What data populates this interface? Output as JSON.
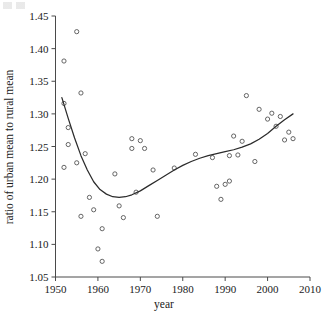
{
  "chart_data": {
    "type": "scatter",
    "title": "",
    "xlabel": "year",
    "ylabel": "ratio of urban mean to rural mean",
    "xlim": [
      1950,
      2010
    ],
    "ylim": [
      1.05,
      1.45
    ],
    "xticks": [
      1950,
      1960,
      1970,
      1980,
      1990,
      2000,
      2010
    ],
    "yticks": [
      1.05,
      1.1,
      1.15,
      1.2,
      1.25,
      1.3,
      1.35,
      1.4,
      1.45
    ],
    "xtick_labels": [
      "1950",
      "1960",
      "1970",
      "1980",
      "1990",
      "2000",
      "2010"
    ],
    "ytick_labels": [
      "1.05",
      "1.10",
      "1.15",
      "1.20",
      "1.25",
      "1.30",
      "1.35",
      "1.40",
      "1.45"
    ],
    "grid": false,
    "legend": "none",
    "marker": "open-circle",
    "points": [
      {
        "x": 1952,
        "y": 1.381
      },
      {
        "x": 1952,
        "y": 1.316
      },
      {
        "x": 1952,
        "y": 1.218
      },
      {
        "x": 1953,
        "y": 1.279
      },
      {
        "x": 1953,
        "y": 1.253
      },
      {
        "x": 1955,
        "y": 1.426
      },
      {
        "x": 1955,
        "y": 1.225
      },
      {
        "x": 1956,
        "y": 1.332
      },
      {
        "x": 1956,
        "y": 1.143
      },
      {
        "x": 1957,
        "y": 1.239
      },
      {
        "x": 1958,
        "y": 1.172
      },
      {
        "x": 1959,
        "y": 1.153
      },
      {
        "x": 1960,
        "y": 1.093
      },
      {
        "x": 1961,
        "y": 1.124
      },
      {
        "x": 1961,
        "y": 1.074
      },
      {
        "x": 1964,
        "y": 1.208
      },
      {
        "x": 1965,
        "y": 1.159
      },
      {
        "x": 1966,
        "y": 1.141
      },
      {
        "x": 1968,
        "y": 1.262
      },
      {
        "x": 1968,
        "y": 1.247
      },
      {
        "x": 1969,
        "y": 1.18
      },
      {
        "x": 1970,
        "y": 1.259
      },
      {
        "x": 1971,
        "y": 1.247
      },
      {
        "x": 1973,
        "y": 1.214
      },
      {
        "x": 1974,
        "y": 1.143
      },
      {
        "x": 1978,
        "y": 1.217
      },
      {
        "x": 1983,
        "y": 1.238
      },
      {
        "x": 1987,
        "y": 1.233
      },
      {
        "x": 1988,
        "y": 1.189
      },
      {
        "x": 1989,
        "y": 1.169
      },
      {
        "x": 1990,
        "y": 1.192
      },
      {
        "x": 1991,
        "y": 1.197
      },
      {
        "x": 1991,
        "y": 1.236
      },
      {
        "x": 1992,
        "y": 1.266
      },
      {
        "x": 1993,
        "y": 1.237
      },
      {
        "x": 1994,
        "y": 1.258
      },
      {
        "x": 1995,
        "y": 1.328
      },
      {
        "x": 1997,
        "y": 1.227
      },
      {
        "x": 1998,
        "y": 1.307
      },
      {
        "x": 2000,
        "y": 1.292
      },
      {
        "x": 2001,
        "y": 1.301
      },
      {
        "x": 2002,
        "y": 1.281
      },
      {
        "x": 2003,
        "y": 1.296
      },
      {
        "x": 2004,
        "y": 1.26
      },
      {
        "x": 2005,
        "y": 1.272
      },
      {
        "x": 2006,
        "y": 1.262
      }
    ],
    "fit_curve": {
      "name": "smoothing spline fit",
      "x": [
        1951.5,
        1953,
        1954.5,
        1956,
        1957.5,
        1959,
        1960.5,
        1962,
        1963.5,
        1965,
        1966.5,
        1968,
        1970,
        1972,
        1974,
        1976,
        1978,
        1980,
        1982,
        1984,
        1986,
        1988,
        1990,
        1992,
        1994,
        1996,
        1998,
        2000,
        2002,
        2004,
        2006
      ],
      "y": [
        1.325,
        1.293,
        1.263,
        1.236,
        1.214,
        1.196,
        1.184,
        1.177,
        1.173,
        1.172,
        1.173,
        1.176,
        1.182,
        1.19,
        1.198,
        1.206,
        1.214,
        1.221,
        1.227,
        1.232,
        1.236,
        1.239,
        1.242,
        1.245,
        1.249,
        1.254,
        1.261,
        1.27,
        1.281,
        1.291,
        1.3
      ]
    }
  },
  "colors": {
    "axis": "#4a4a4a",
    "marker": "#555555",
    "fit_line": "#2b2b2b",
    "text": "#1a1a1a",
    "background": "#ffffff"
  }
}
